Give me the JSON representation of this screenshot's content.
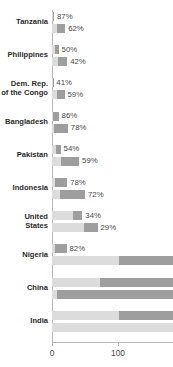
{
  "chart_data": {
    "type": "bar",
    "orientation": "horizontal",
    "title": "",
    "subtitle": "",
    "xlabel": "",
    "ylabel": "",
    "xlim": [
      0,
      183
    ],
    "grid": false,
    "legend": null,
    "axis_ticks": [
      {
        "value": 0,
        "label": "0"
      },
      {
        "value": 100,
        "label": "100"
      }
    ],
    "categories": [
      "Tanzania",
      "Philippines",
      "Dem. Rep.\nof the Congo",
      "Bangladesh",
      "Pakistan",
      "Indonesia",
      "United\nStates",
      "Nigeria",
      "China",
      "India"
    ],
    "bars": [
      {
        "category": "Tanzania",
        "upper": {
          "total": 3,
          "light": 1,
          "dark": 2,
          "label": "87%"
        },
        "lower": {
          "total": 20,
          "light": 7,
          "dark": 13,
          "label": "62%"
        }
      },
      {
        "category": "Philippines",
        "upper": {
          "total": 10,
          "light": 4,
          "dark": 6,
          "label": "50%"
        },
        "lower": {
          "total": 23,
          "light": 9,
          "dark": 14,
          "label": "42%"
        }
      },
      {
        "category": "Dem. Rep.\nof the Congo",
        "upper": {
          "total": 2,
          "light": 1,
          "dark": 1,
          "label": "41%"
        },
        "lower": {
          "total": 19,
          "light": 7,
          "dark": 12,
          "label": "59%"
        }
      },
      {
        "category": "Bangladesh",
        "upper": {
          "total": 10,
          "light": 2,
          "dark": 8,
          "label": "86%"
        },
        "lower": {
          "total": 24,
          "light": 3,
          "dark": 21,
          "label": "78%"
        }
      },
      {
        "category": "Pakistan",
        "upper": {
          "total": 13,
          "light": 6,
          "dark": 7,
          "label": "54%"
        },
        "lower": {
          "total": 41,
          "light": 14,
          "dark": 27,
          "label": "59%"
        }
      },
      {
        "category": "Indonesia",
        "upper": {
          "total": 23,
          "light": 5,
          "dark": 18,
          "label": "78%"
        },
        "lower": {
          "total": 50,
          "light": 12,
          "dark": 38,
          "label": "72%"
        }
      },
      {
        "category": "United\nStates",
        "upper": {
          "total": 46,
          "light": 32,
          "dark": 14,
          "label": "34%"
        },
        "lower": {
          "total": 69,
          "light": 48,
          "dark": 21,
          "label": "29%"
        }
      },
      {
        "category": "Nigeria",
        "upper": {
          "total": 22,
          "light": 4,
          "dark": 18,
          "label": "82%"
        },
        "lower": {
          "total": 183,
          "light": 101,
          "dark": 82,
          "label": ""
        }
      },
      {
        "category": "China",
        "upper": {
          "total": 183,
          "light": 72,
          "dark": 111,
          "label": ""
        },
        "lower": {
          "total": 183,
          "light": 8,
          "dark": 175,
          "label": ""
        }
      },
      {
        "category": "India",
        "upper": {
          "total": 183,
          "light": 101,
          "dark": 82,
          "label": ""
        },
        "lower": {
          "total": 183,
          "light": 183,
          "dark": 0,
          "label": ""
        }
      }
    ],
    "colors": {
      "segment_light": "#dcdcdc",
      "segment_dark": "#9e9e9e",
      "axis": "#b8b8b8",
      "label_text": "#2b2b2b",
      "value_text": "#4a4a4a",
      "background": "#ffffff"
    }
  }
}
